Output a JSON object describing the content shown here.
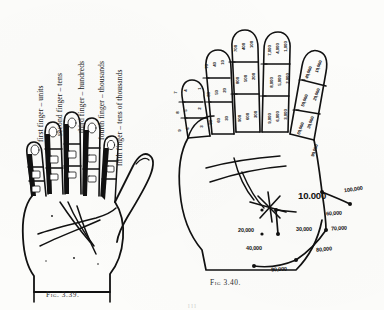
{
  "page": {
    "background_color": "#fcfcfa",
    "ink_color": "#111111",
    "bottom_edge_text": "l     l     l"
  },
  "figures": [
    {
      "id": "fig-3-39",
      "caption": "Fig. 3.39.",
      "description": "left-hand palm diagram with finger place-value labels",
      "labels": [
        {
          "name": "first-finger-label",
          "text": "first finger – units"
        },
        {
          "name": "second-finger-label",
          "text": "second finger – tens"
        },
        {
          "name": "third-finger-label",
          "text": "third finger – hundreds"
        },
        {
          "name": "fourth-finger-label",
          "text": "fourth finger – thousands"
        },
        {
          "name": "fifth-finger-label",
          "text": "fifth finger – tens of thousands"
        }
      ]
    },
    {
      "id": "fig-3-40",
      "caption": "Fig 3.40.",
      "description": "right-hand palm diagram with numeric joint values",
      "finger_numbers": {
        "thumb_units": [
          "1",
          "2",
          "3",
          "4",
          "5",
          "6",
          "7",
          "8",
          "9"
        ],
        "index_tens": [
          "10",
          "20",
          "30",
          "40",
          "50",
          "60",
          "70",
          "80",
          "90"
        ],
        "middle_hundreds": [
          "100",
          "200",
          "300",
          "400",
          "500",
          "600",
          "700",
          "800",
          "900"
        ],
        "ring_thousands": [
          "1,000",
          "2,000",
          "3,000",
          "4,000",
          "5,000",
          "6,000",
          "7,000",
          "8,000",
          "9,000"
        ],
        "little_ten_thousands": [
          "10,000",
          "20,000",
          "30,000",
          "40,000",
          "50,000",
          "60,000",
          "70,000",
          "80,000",
          "90,000",
          "100,000"
        ]
      },
      "palm_numbers": [
        {
          "name": "palm-value-10000",
          "text": "10.000",
          "x": 122,
          "y": 170,
          "size": "big"
        },
        {
          "name": "palm-value-100000",
          "text": "100,000",
          "x": 168,
          "y": 166,
          "size": "mid"
        },
        {
          "name": "palm-value-60000",
          "text": "60,000",
          "x": 150,
          "y": 190,
          "size": "mid"
        },
        {
          "name": "palm-value-70000",
          "text": "70,000",
          "x": 155,
          "y": 205,
          "size": "mid"
        },
        {
          "name": "palm-value-20000",
          "text": "20,000",
          "x": 62,
          "y": 207,
          "size": "mid"
        },
        {
          "name": "palm-value-30000",
          "text": "30,000",
          "x": 120,
          "y": 206,
          "size": "mid"
        },
        {
          "name": "palm-value-40000",
          "text": "40,000",
          "x": 70,
          "y": 225,
          "size": "mid"
        },
        {
          "name": "palm-value-80000",
          "text": "80,000",
          "x": 140,
          "y": 226,
          "size": "mid"
        },
        {
          "name": "palm-value-90000",
          "text": "90,000",
          "x": 95,
          "y": 246,
          "size": "mid"
        }
      ]
    }
  ]
}
